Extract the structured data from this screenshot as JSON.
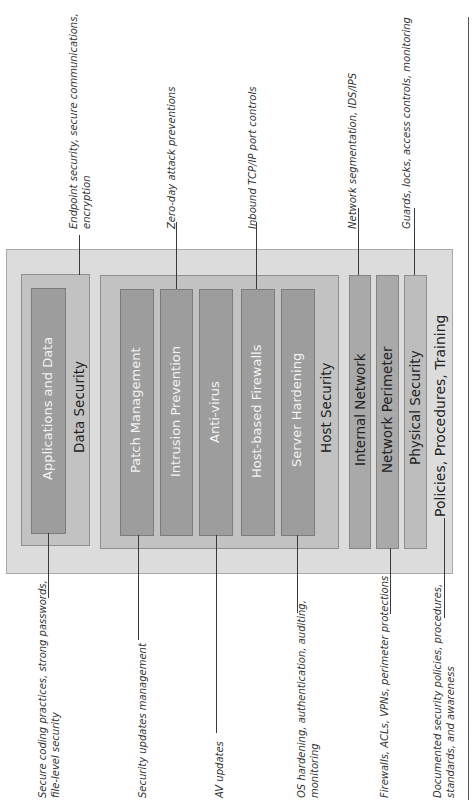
{
  "diagram": {
    "layers": {
      "policies": "Policies, Procedures, Training",
      "physical": "Physical Security",
      "perimeter": "Network Perimeter",
      "internal": "Internal Network",
      "host": {
        "label": "Host Security",
        "items": [
          "Patch Management",
          "Intrusion Prevention",
          "Anti-virus",
          "Host-based Firewalls",
          "Server Hardening"
        ]
      },
      "data": {
        "label": "Data Security",
        "items": [
          "Applications and Data"
        ]
      }
    },
    "callouts_top": {
      "data": [
        "Endpoint security, secure communications,",
        "encryption"
      ],
      "intrusion": "Zero-day attack preventions",
      "firewalls": "Inbound TCP/IP port controls",
      "internal": "Network segmentation, IDS/IPS",
      "physical": "Guards, locks, access controls, monitoring"
    },
    "callouts_bottom": {
      "applications": [
        "Secure coding practices, strong passwords,",
        "file-level security"
      ],
      "patch": "Security updates management",
      "antivirus": "AV updates",
      "hardening": [
        "OS hardening, authentication, auditing,",
        "monitoring"
      ],
      "perimeter": "Firewalls, ACLs, VPNs, perimeter protections",
      "policies": [
        "Documented security policies, procedures,",
        "standards, and awareness"
      ]
    },
    "colors": {
      "outer_fill": "#dcdcdc",
      "group_fill": "#c2c2c2",
      "bar_fill": "#9d9d9d",
      "line": "#3a3a3a"
    }
  }
}
